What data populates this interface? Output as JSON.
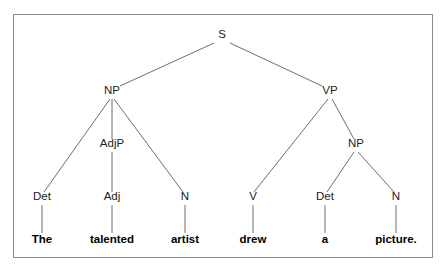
{
  "diagram": {
    "kind": "constituency-syntax-tree",
    "sentence": "The talented artist drew a picture.",
    "border_color": "#8c8c8c",
    "line_color": "#5d5d5d",
    "text_color": "#1c1c1c",
    "background": "#ffffff"
  },
  "nodes": {
    "s": {
      "label": "S",
      "x": 222,
      "y": 38
    },
    "np_subject": {
      "label": "NP",
      "x": 112,
      "y": 94
    },
    "vp": {
      "label": "VP",
      "x": 330,
      "y": 94
    },
    "adjp": {
      "label": "AdjP",
      "x": 112,
      "y": 147
    },
    "np_object": {
      "label": "NP",
      "x": 356,
      "y": 147
    },
    "det1": {
      "label": "Det",
      "x": 42,
      "y": 200
    },
    "adj": {
      "label": "Adj",
      "x": 112,
      "y": 200
    },
    "n1": {
      "label": "N",
      "x": 185,
      "y": 200
    },
    "v": {
      "label": "V",
      "x": 253,
      "y": 200
    },
    "det2": {
      "label": "Det",
      "x": 325,
      "y": 200
    },
    "n2": {
      "label": "N",
      "x": 396,
      "y": 200
    }
  },
  "words": {
    "the": {
      "label": "The",
      "x": 42,
      "y": 243
    },
    "talented": {
      "label": "talented",
      "x": 112,
      "y": 243
    },
    "artist": {
      "label": "artist",
      "x": 185,
      "y": 243
    },
    "drew": {
      "label": "drew",
      "x": 253,
      "y": 243
    },
    "a": {
      "label": "a",
      "x": 325,
      "y": 243
    },
    "picture": {
      "label": "picture.",
      "x": 396,
      "y": 243
    }
  },
  "edges": [
    {
      "name": "s-to-np-subject",
      "x1": 214,
      "y1": 43,
      "x2": 120,
      "y2": 86
    },
    {
      "name": "s-to-vp",
      "x1": 230,
      "y1": 43,
      "x2": 322,
      "y2": 86
    },
    {
      "name": "np-subject-to-det",
      "x1": 110,
      "y1": 99,
      "x2": 44,
      "y2": 192
    },
    {
      "name": "np-subject-to-adjp",
      "x1": 112,
      "y1": 99,
      "x2": 112,
      "y2": 139
    },
    {
      "name": "np-subject-to-n",
      "x1": 114,
      "y1": 99,
      "x2": 183,
      "y2": 192
    },
    {
      "name": "adjp-to-adj",
      "x1": 112,
      "y1": 152,
      "x2": 112,
      "y2": 192
    },
    {
      "name": "vp-to-v",
      "x1": 328,
      "y1": 99,
      "x2": 254,
      "y2": 192
    },
    {
      "name": "vp-to-np-object",
      "x1": 332,
      "y1": 99,
      "x2": 354,
      "y2": 139
    },
    {
      "name": "np-object-to-det",
      "x1": 354,
      "y1": 152,
      "x2": 327,
      "y2": 192
    },
    {
      "name": "np-object-to-n",
      "x1": 358,
      "y1": 152,
      "x2": 394,
      "y2": 192
    },
    {
      "name": "det1-to-the",
      "x1": 42,
      "y1": 205,
      "x2": 42,
      "y2": 233
    },
    {
      "name": "adj-to-talented",
      "x1": 112,
      "y1": 205,
      "x2": 112,
      "y2": 233
    },
    {
      "name": "n1-to-artist",
      "x1": 185,
      "y1": 205,
      "x2": 185,
      "y2": 233
    },
    {
      "name": "v-to-drew",
      "x1": 253,
      "y1": 205,
      "x2": 253,
      "y2": 233
    },
    {
      "name": "det2-to-a",
      "x1": 325,
      "y1": 205,
      "x2": 325,
      "y2": 233
    },
    {
      "name": "n2-to-picture",
      "x1": 396,
      "y1": 205,
      "x2": 396,
      "y2": 233
    }
  ]
}
